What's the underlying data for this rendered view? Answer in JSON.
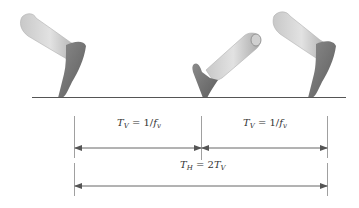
{
  "diagram": {
    "colors": {
      "ground": "#555555",
      "dimension_line": "#666666",
      "leg_light": "#bdbdbd",
      "leg_mid": "#9a9a9a",
      "foot_dark": "#6e6e6e"
    },
    "figures": [
      {
        "name": "leg-heel-off-left",
        "pose": "toe-off"
      },
      {
        "name": "leg-heel-strike-middle",
        "pose": "heel-strike"
      },
      {
        "name": "leg-heel-off-right",
        "pose": "toe-off"
      }
    ],
    "labels": {
      "tv_first": {
        "symbol": "T",
        "sub": "V",
        "eq": " = 1/",
        "f": "f",
        "fsub": "v"
      },
      "tv_second": {
        "symbol": "T",
        "sub": "V",
        "eq": " = 1/",
        "f": "f",
        "fsub": "v"
      },
      "th": {
        "symbol": "T",
        "sub": "H",
        "eq": " = 2",
        "t2": "T",
        "t2sub": "V"
      }
    }
  }
}
